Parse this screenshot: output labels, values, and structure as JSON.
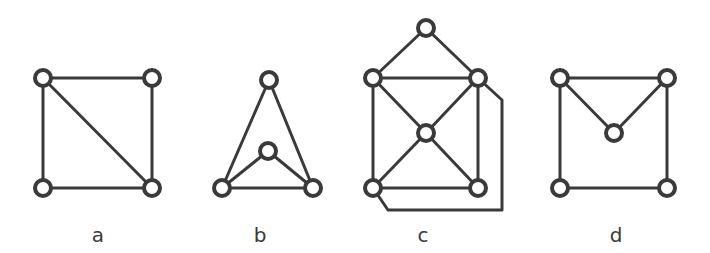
{
  "figure": {
    "colors": {
      "stroke": "#3a3a3a",
      "node_fill": "#ffffff",
      "background": "#ffffff"
    },
    "graphs": [
      {
        "id": "a",
        "label": "a",
        "label_pos": [
          98,
          242
        ],
        "nodes": [
          [
            43,
            78
          ],
          [
            152,
            78
          ],
          [
            43,
            188
          ],
          [
            152,
            188
          ]
        ],
        "edges": [
          [
            0,
            1
          ],
          [
            0,
            2
          ],
          [
            1,
            3
          ],
          [
            2,
            3
          ],
          [
            0,
            3
          ]
        ],
        "paths": []
      },
      {
        "id": "b",
        "label": "b",
        "label_pos": [
          260,
          242
        ],
        "nodes": [
          [
            269,
            80
          ],
          [
            268,
            151
          ],
          [
            222,
            188
          ],
          [
            313,
            188
          ]
        ],
        "edges": [
          [
            0,
            2
          ],
          [
            0,
            3
          ],
          [
            2,
            3
          ],
          [
            1,
            2
          ],
          [
            1,
            3
          ]
        ],
        "paths": []
      },
      {
        "id": "c",
        "label": "c",
        "label_pos": [
          423,
          242
        ],
        "nodes": [
          [
            426,
            28
          ],
          [
            373,
            78
          ],
          [
            478,
            78
          ],
          [
            426,
            133
          ],
          [
            373,
            188
          ],
          [
            478,
            188
          ]
        ],
        "edges": [
          [
            0,
            1
          ],
          [
            0,
            2
          ],
          [
            1,
            2
          ],
          [
            1,
            4
          ],
          [
            2,
            5
          ],
          [
            4,
            5
          ],
          [
            1,
            3
          ],
          [
            2,
            3
          ],
          [
            3,
            4
          ],
          [
            3,
            5
          ]
        ],
        "paths": [
          [
            [
              478,
              78
            ],
            [
              502,
              100
            ],
            [
              502,
              210
            ],
            [
              388,
              210
            ],
            [
              373,
              188
            ]
          ]
        ]
      },
      {
        "id": "d",
        "label": "d",
        "label_pos": [
          616,
          242
        ],
        "nodes": [
          [
            560,
            78
          ],
          [
            667,
            78
          ],
          [
            614,
            133
          ],
          [
            560,
            188
          ],
          [
            667,
            188
          ]
        ],
        "edges": [
          [
            0,
            1
          ],
          [
            0,
            3
          ],
          [
            1,
            4
          ],
          [
            3,
            4
          ],
          [
            0,
            2
          ],
          [
            1,
            2
          ]
        ],
        "paths": []
      }
    ],
    "node_radius": 8
  }
}
